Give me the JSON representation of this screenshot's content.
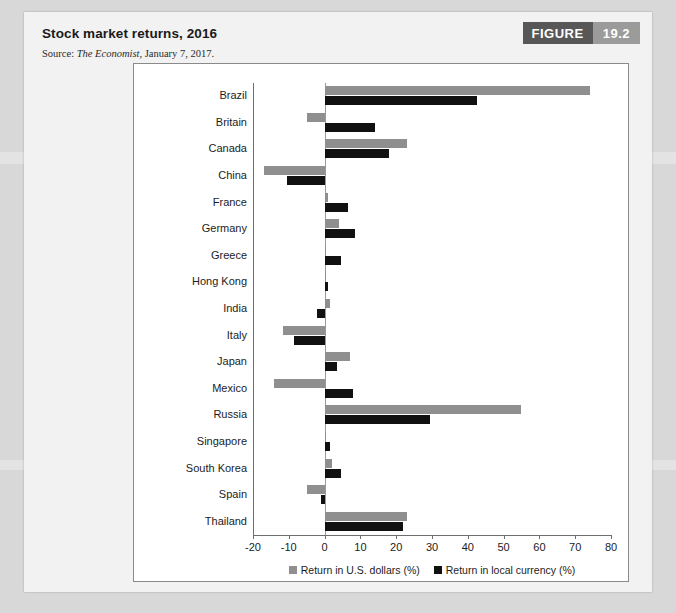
{
  "figure": {
    "badge_label": "FIGURE",
    "badge_number": "19.2",
    "title": "Stock market returns, 2016",
    "source_prefix": "Source: ",
    "source_publication": "The Economist",
    "source_suffix": ", January 7, 2017."
  },
  "colors": {
    "usd_bar": "#8f8f8f",
    "local_bar": "#111111",
    "badge_dark": "#575757",
    "badge_light": "#9b9b9b",
    "card_bg": "#f2f2f2",
    "plot_bg": "#ffffff",
    "axis": "#6e6e6e"
  },
  "chart_data": {
    "type": "bar",
    "orientation": "horizontal",
    "title": "Stock market returns, 2016",
    "xlabel": "",
    "ylabel": "",
    "xlim": [
      -20,
      80
    ],
    "xticks": [
      -20,
      -10,
      0,
      10,
      20,
      30,
      40,
      50,
      60,
      70,
      80
    ],
    "xtick_labels": [
      "-20",
      "-10",
      "0",
      "10",
      "20",
      "30",
      "40",
      "50",
      "60",
      "70",
      "80"
    ],
    "grid": false,
    "legend_position": "bottom",
    "categories": [
      "Brazil",
      "Britain",
      "Canada",
      "China",
      "France",
      "Germany",
      "Greece",
      "Hong Kong",
      "India",
      "Italy",
      "Japan",
      "Mexico",
      "Russia",
      "Singapore",
      "South Korea",
      "Spain",
      "Thailand"
    ],
    "series": [
      {
        "name": "Return in U.S. dollars (%)",
        "color": "#8f8f8f",
        "values": [
          74,
          -5,
          23,
          -17,
          1,
          4,
          0.5,
          0.5,
          1.5,
          -11.5,
          7,
          -14,
          55,
          0.3,
          2,
          -5,
          23
        ]
      },
      {
        "name": "Return in local currency (%)",
        "color": "#111111",
        "values": [
          42.5,
          14,
          18,
          -10.5,
          6.5,
          8.5,
          4.5,
          1,
          -2,
          -8.5,
          3.5,
          8,
          29.5,
          1.5,
          4.5,
          -1,
          22
        ]
      }
    ]
  }
}
